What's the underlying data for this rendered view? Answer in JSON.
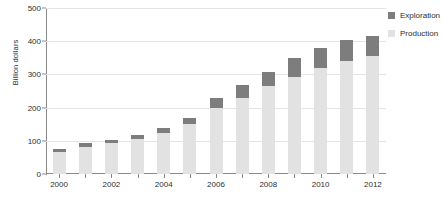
{
  "chart_data": {
    "type": "bar",
    "stacked": true,
    "title": "",
    "xlabel": "",
    "ylabel": "Billion dollars",
    "ylim": [
      0,
      500
    ],
    "yticks": [
      0,
      100,
      200,
      300,
      400,
      500
    ],
    "ytick_labels": [
      "0",
      "100",
      "200",
      "300",
      "400",
      "500"
    ],
    "grid": true,
    "legend_position": "top-right",
    "categories": [
      2000,
      2001,
      2002,
      2003,
      2004,
      2005,
      2006,
      2007,
      2008,
      2009,
      2010,
      2011,
      2012
    ],
    "xtick_labels": [
      "2000",
      "2002",
      "2004",
      "2006",
      "2008",
      "2010",
      "2012"
    ],
    "xtick_values": [
      2000,
      2002,
      2004,
      2006,
      2008,
      2010,
      2012
    ],
    "series": [
      {
        "name": "Production",
        "color": "#e2e2e2",
        "values": [
          65,
          80,
          92,
          105,
          125,
          150,
          200,
          230,
          265,
          292,
          318,
          340,
          355
        ]
      },
      {
        "name": "Exploration",
        "color": "#7d7d7d",
        "values": [
          10,
          12,
          12,
          12,
          14,
          20,
          28,
          38,
          43,
          56,
          62,
          63,
          60
        ]
      }
    ],
    "totals": [
      75,
      92,
      104,
      117,
      139,
      170,
      228,
      268,
      308,
      348,
      380,
      403,
      415
    ]
  },
  "legend": {
    "items": [
      {
        "label": "Exploration",
        "color": "#7d7d7d"
      },
      {
        "label": "Production",
        "color": "#e2e2e2"
      }
    ]
  },
  "axis": {
    "y_title": "Billion dollars"
  }
}
